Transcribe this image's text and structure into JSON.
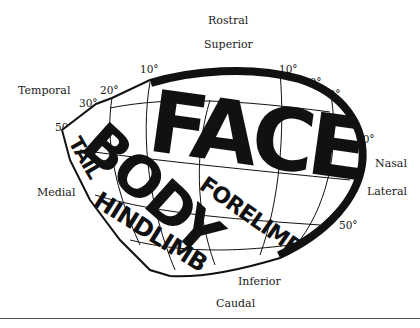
{
  "figure": {
    "type": "somatotopic map",
    "outline_color": "#111111",
    "background": "#ffffff"
  },
  "direction_labels": {
    "rostral": "Rostral",
    "superior": "Superior",
    "temporal": "Temporal",
    "medial": "Medial",
    "nasal": "Nasal",
    "lateral": "Lateral",
    "inferior": "Inferior",
    "caudal": "Caudal"
  },
  "degree_labels": {
    "left_10": "10°",
    "left_20": "20°",
    "left_30": "30°",
    "left_50": "50°",
    "center_0": "0°",
    "right_10": "10°",
    "right_20": "20°",
    "right_30": "30°",
    "right_40": "40°",
    "right_50": "50°"
  },
  "body_regions": {
    "face": "FACE",
    "body": "BODY",
    "forelimb": "FORELIMB",
    "tail": "TAIL",
    "hindlimb": "HINDLIMB"
  }
}
